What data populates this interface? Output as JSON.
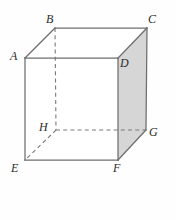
{
  "figure": {
    "name": "labelled-cube-diagram",
    "shape": "cube",
    "canvas": {
      "width": 176,
      "height": 220
    },
    "colors": {
      "background": "#fefefe",
      "edge_solid": "#6e6e6e",
      "edge_hidden": "#7a7a7a",
      "face_shaded": "#d6d6d6",
      "face_plain": "#ffffff",
      "label_text": "#2b2b2b"
    },
    "vertices": [
      {
        "id": "A",
        "label": "A",
        "x": 25,
        "y": 58,
        "label_x": 10,
        "label_y": 50,
        "hidden": false
      },
      {
        "id": "B",
        "label": "B",
        "x": 55,
        "y": 28,
        "label_x": 46,
        "label_y": 13,
        "hidden": false
      },
      {
        "id": "C",
        "label": "C",
        "x": 147,
        "y": 28,
        "label_x": 148,
        "label_y": 13,
        "hidden": false
      },
      {
        "id": "D",
        "label": "D",
        "x": 118,
        "y": 58,
        "label_x": 120,
        "label_y": 57,
        "hidden": false
      },
      {
        "id": "E",
        "label": "E",
        "x": 25,
        "y": 160,
        "label_x": 11,
        "label_y": 162,
        "hidden": false
      },
      {
        "id": "F",
        "label": "F",
        "x": 118,
        "y": 160,
        "label_x": 113,
        "label_y": 162,
        "hidden": false
      },
      {
        "id": "G",
        "label": "G",
        "x": 146,
        "y": 130,
        "label_x": 149,
        "label_y": 126,
        "hidden": false
      },
      {
        "id": "H",
        "label": "H",
        "x": 56,
        "y": 130,
        "label_x": 39,
        "label_y": 121,
        "hidden": true
      }
    ],
    "faces": [
      {
        "id": "right-face",
        "points": "118,58 147,28 146,130 118,160",
        "fill": "#d6d6d6",
        "shaded": true
      },
      {
        "id": "front-face",
        "points": "25,58 118,58 118,160 25,160",
        "fill": "#ffffff",
        "shaded": false
      },
      {
        "id": "top-face",
        "points": "25,58 55,28 147,28 118,58",
        "fill": "#ffffff",
        "shaded": false
      }
    ],
    "edges_solid": [
      {
        "id": "edge-AB",
        "from": "A",
        "to": "B",
        "x1": 25,
        "y1": 58,
        "x2": 55,
        "y2": 28
      },
      {
        "id": "edge-BC",
        "from": "B",
        "to": "C",
        "x1": 55,
        "y1": 28,
        "x2": 147,
        "y2": 28
      },
      {
        "id": "edge-CD",
        "from": "C",
        "to": "D",
        "x1": 147,
        "y1": 28,
        "x2": 118,
        "y2": 58
      },
      {
        "id": "edge-AD",
        "from": "A",
        "to": "D",
        "x1": 25,
        "y1": 58,
        "x2": 118,
        "y2": 58
      },
      {
        "id": "edge-AE",
        "from": "A",
        "to": "E",
        "x1": 25,
        "y1": 58,
        "x2": 25,
        "y2": 160
      },
      {
        "id": "edge-DF",
        "from": "D",
        "to": "F",
        "x1": 118,
        "y1": 58,
        "x2": 118,
        "y2": 160
      },
      {
        "id": "edge-CG",
        "from": "C",
        "to": "G",
        "x1": 147,
        "y1": 28,
        "x2": 146,
        "y2": 130
      },
      {
        "id": "edge-EF",
        "from": "E",
        "to": "F",
        "x1": 25,
        "y1": 160,
        "x2": 118,
        "y2": 160
      },
      {
        "id": "edge-FG",
        "from": "F",
        "to": "G",
        "x1": 118,
        "y1": 160,
        "x2": 146,
        "y2": 130
      }
    ],
    "edges_hidden": [
      {
        "id": "edge-BH",
        "from": "B",
        "to": "H",
        "x1": 55,
        "y1": 28,
        "x2": 56,
        "y2": 130
      },
      {
        "id": "edge-HG",
        "from": "H",
        "to": "G",
        "x1": 56,
        "y1": 130,
        "x2": 146,
        "y2": 130
      },
      {
        "id": "edge-HE",
        "from": "H",
        "to": "E",
        "x1": 56,
        "y1": 130,
        "x2": 25,
        "y2": 160
      }
    ]
  }
}
